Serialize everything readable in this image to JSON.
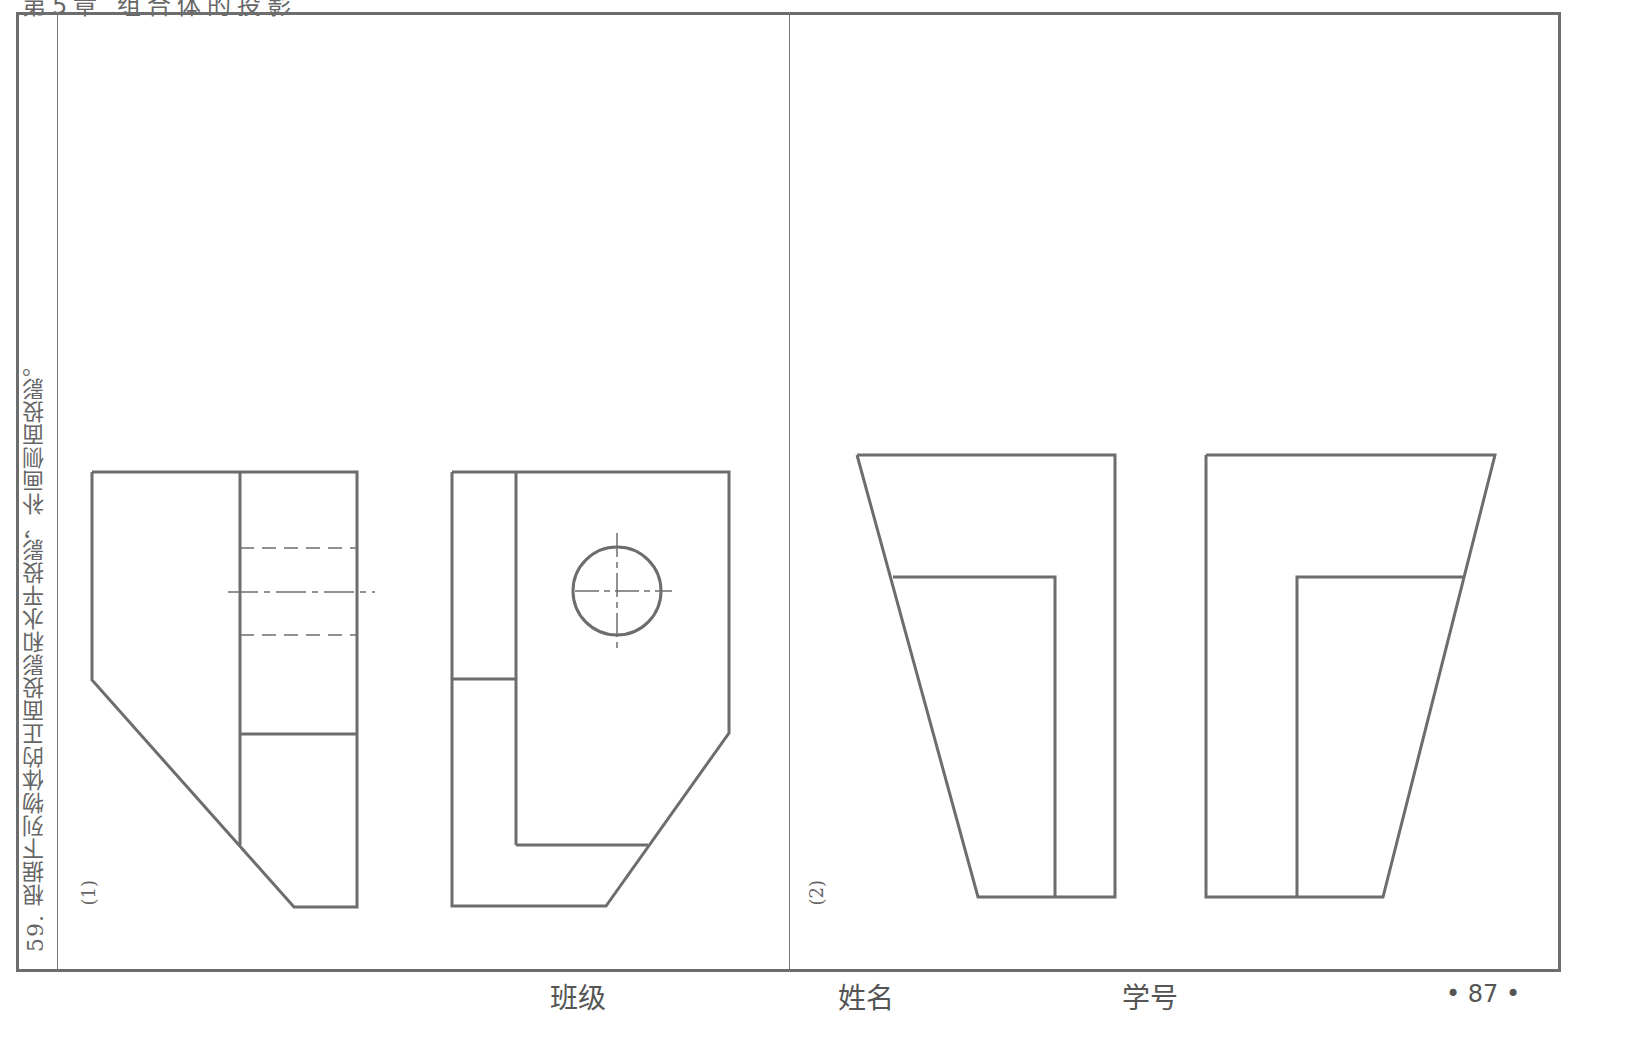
{
  "header": {
    "chapter_title_clipped": "第5章 组合体的投影"
  },
  "question": {
    "number": "59.",
    "text": "根据下列物体的正面投影和水平投影，补画侧面投影。"
  },
  "problems": [
    {
      "label": "(1)",
      "views": [
        "front-projection",
        "horizontal-projection"
      ]
    },
    {
      "label": "(2)",
      "views": [
        "front-projection",
        "horizontal-projection"
      ]
    }
  ],
  "footer": {
    "class_label": "班级",
    "name_label": "姓名",
    "student_id_label": "学号",
    "page_number": "• 87 •"
  },
  "colors": {
    "line": "#6d6d6d",
    "text": "#555555",
    "background": "#ffffff"
  }
}
